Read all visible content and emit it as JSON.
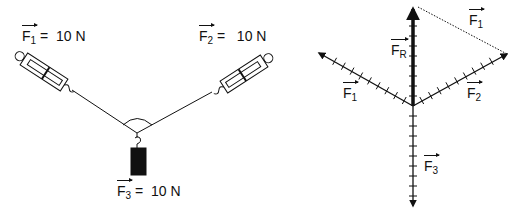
{
  "left_diagram": {
    "labels": {
      "f1": {
        "symbol": "F",
        "sub": "1",
        "text": " =  10 N"
      },
      "f2": {
        "symbol": "F",
        "sub": "2",
        "text": " =   10 N"
      },
      "f3": {
        "symbol": "F",
        "sub": "3",
        "text": " =  10 N"
      }
    },
    "components": [
      "spring-scale-left",
      "spring-scale-right",
      "string-junction",
      "hanging-mass"
    ]
  },
  "right_diagram": {
    "labels": {
      "fr": {
        "symbol": "F",
        "sub": "R"
      },
      "f1_side": {
        "symbol": "F",
        "sub": "1"
      },
      "f1_top": {
        "symbol": "F",
        "sub": "1"
      },
      "f2": {
        "symbol": "F",
        "sub": "2"
      },
      "f3": {
        "symbol": "F",
        "sub": "3"
      }
    },
    "vectors": [
      {
        "name": "F1",
        "magnitude_N": 10,
        "direction": "up-left"
      },
      {
        "name": "F2",
        "magnitude_N": 10,
        "direction": "up-right"
      },
      {
        "name": "F3",
        "magnitude_N": 10,
        "direction": "down"
      },
      {
        "name": "FR",
        "direction": "up",
        "note": "resultant of F1 and F2"
      }
    ],
    "colors": {
      "ink": "#111111"
    }
  }
}
